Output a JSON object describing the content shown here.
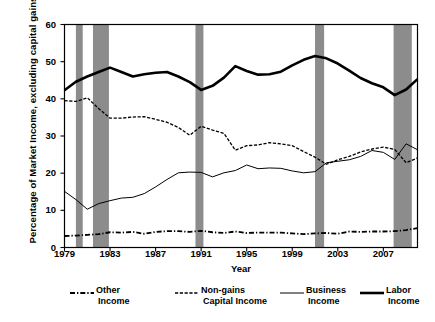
{
  "chart_data": {
    "type": "line",
    "title": "",
    "xlabel": "Year",
    "ylabel": "Percentage of Market Income, excluding capital gains",
    "xlim": [
      1979,
      2010
    ],
    "ylim": [
      0,
      60
    ],
    "yticks": [
      0,
      10,
      20,
      30,
      40,
      50,
      60
    ],
    "xticks": [
      1979,
      1983,
      1987,
      1991,
      1995,
      1999,
      2003,
      2007
    ],
    "grid": false,
    "legend_position": "below-axes",
    "x": [
      1979,
      1980,
      1981,
      1982,
      1983,
      1984,
      1985,
      1986,
      1987,
      1988,
      1989,
      1990,
      1991,
      1992,
      1993,
      1994,
      1995,
      1996,
      1997,
      1998,
      1999,
      2000,
      2001,
      2002,
      2003,
      2004,
      2005,
      2006,
      2007,
      2008,
      2009,
      2010
    ],
    "series": [
      {
        "name": "Labor Income",
        "style": "thick-solid",
        "color": "#000000",
        "values": [
          42.3,
          44.6,
          46.0,
          47.2,
          48.4,
          47.2,
          46.0,
          46.6,
          47.0,
          47.2,
          46.0,
          44.5,
          42.4,
          43.5,
          45.7,
          48.8,
          47.5,
          46.5,
          46.6,
          47.3,
          49.0,
          50.5,
          51.5,
          50.9,
          49.5,
          47.6,
          45.6,
          44.2,
          43.1,
          41.0,
          42.5,
          45.3
        ]
      },
      {
        "name": "Non-gains Capital Income",
        "style": "dashed",
        "color": "#000000",
        "values": [
          39.5,
          39.3,
          40.3,
          37.4,
          34.8,
          34.8,
          35.1,
          35.2,
          34.5,
          33.7,
          32.3,
          30.2,
          32.6,
          31.6,
          30.7,
          26.2,
          27.4,
          27.6,
          28.2,
          27.9,
          27.4,
          25.8,
          24.3,
          22.4,
          23.6,
          24.5,
          25.7,
          26.5,
          27.0,
          26.4,
          22.8,
          24.1
        ]
      },
      {
        "name": "Business Income",
        "style": "thin-solid",
        "color": "#000000",
        "values": [
          15.1,
          12.9,
          10.3,
          11.8,
          12.6,
          13.3,
          13.5,
          14.5,
          16.3,
          18.3,
          20.1,
          20.3,
          20.2,
          19.0,
          20.1,
          20.7,
          22.2,
          21.2,
          21.4,
          21.3,
          20.6,
          20.1,
          20.4,
          22.8,
          23.2,
          23.6,
          24.5,
          26.1,
          25.6,
          23.7,
          27.9,
          26.3
        ]
      },
      {
        "name": "Other Income",
        "style": "dash-dot",
        "color": "#000000",
        "values": [
          3.1,
          3.2,
          3.4,
          3.6,
          4.1,
          4.0,
          4.2,
          3.7,
          4.2,
          4.4,
          4.4,
          4.2,
          4.5,
          4.1,
          3.9,
          4.3,
          3.9,
          4.0,
          4.0,
          4.0,
          3.8,
          3.6,
          3.8,
          3.9,
          3.7,
          4.3,
          4.2,
          4.3,
          4.3,
          4.4,
          4.7,
          5.2
        ]
      }
    ],
    "shaded_regions": {
      "name": "recession-bands",
      "color": "#8c8c8c",
      "bands": [
        {
          "start": 1980.0,
          "end": 1980.6
        },
        {
          "start": 1981.5,
          "end": 1982.9
        },
        {
          "start": 1990.5,
          "end": 1991.2
        },
        {
          "start": 2001.0,
          "end": 2001.8
        },
        {
          "start": 2007.9,
          "end": 2009.5
        }
      ]
    }
  },
  "axis": {
    "ylabel": "Percentage of Market Income, excluding capital gains",
    "xlabel": "Year",
    "yticks": [
      "0",
      "10",
      "20",
      "30",
      "40",
      "50",
      "60"
    ],
    "xticks": [
      "1979",
      "1983",
      "1987",
      "1991",
      "1995",
      "1999",
      "2003",
      "2007"
    ]
  },
  "legend": {
    "entries": [
      {
        "swatch": "dash-dot-line",
        "line1": "Other",
        "line2": "Income"
      },
      {
        "swatch": "dashed-line",
        "line1": "Non-gains",
        "line2": "Capital Income"
      },
      {
        "swatch": "thin-solid-line",
        "line1": "Business",
        "line2": "Income"
      },
      {
        "swatch": "thick-solid-line",
        "line1": "Labor",
        "line2": "Income"
      }
    ]
  }
}
